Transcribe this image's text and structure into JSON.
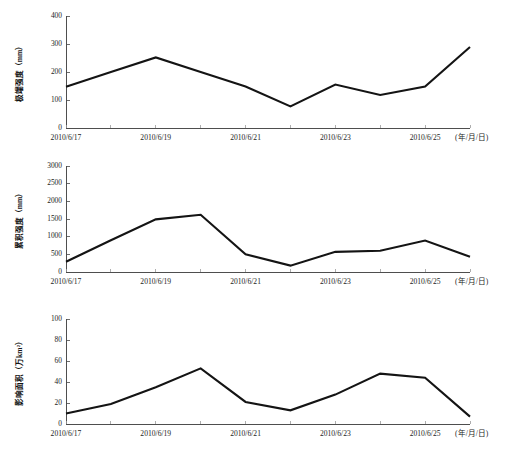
{
  "figure": {
    "background": "#ffffff",
    "line_color": "#141414",
    "axis_color": "#3b3b3b",
    "panel_count": 3
  },
  "chart_data": [
    {
      "type": "line",
      "panel": "top",
      "title": "",
      "xlabel": "(年/月/日)",
      "ylabel": "极端强度（mm）",
      "ylim": [
        0,
        400
      ],
      "yticks": [
        0,
        100,
        200,
        300,
        400
      ],
      "ytick_labels": [
        "0",
        "100",
        "200",
        "300",
        "400"
      ],
      "xlim_index": [
        0,
        9
      ],
      "x": [
        "2010/6/17",
        "2010/6/18",
        "2010/6/19",
        "2010/6/20",
        "2010/6/21",
        "2010/6/22",
        "2010/6/23",
        "2010/6/24",
        "2010/6/25",
        "2010/6/26"
      ],
      "xtick_labels": [
        "2010/6/17",
        "",
        "2010/6/19",
        "",
        "2010/6/21",
        "",
        "2010/6/23",
        "",
        "2010/6/25",
        ""
      ],
      "xtick_labels_visible": [
        "2010/6/17",
        "2010/6/19",
        "2010/6/21",
        "2010/6/23",
        "2010/6/25"
      ],
      "values": [
        147,
        200,
        252,
        200,
        148,
        77,
        155,
        118,
        148,
        289
      ],
      "grid": false,
      "legend": "none",
      "series_name": "极端强度"
    },
    {
      "type": "line",
      "panel": "middle",
      "title": "",
      "xlabel": "(年/月/日)",
      "ylabel": "累积强度（mm）",
      "ylim": [
        0,
        3000
      ],
      "yticks": [
        0,
        500,
        1000,
        1500,
        2000,
        2500,
        3000
      ],
      "ytick_labels": [
        "0",
        "500",
        "1000",
        "1500",
        "2000",
        "2500",
        "3000"
      ],
      "xlim_index": [
        0,
        9
      ],
      "x": [
        "2010/6/17",
        "2010/6/18",
        "2010/6/19",
        "2010/6/20",
        "2010/6/21",
        "2010/6/22",
        "2010/6/23",
        "2010/6/24",
        "2010/6/25",
        "2010/6/26"
      ],
      "xtick_labels": [
        "2010/6/17",
        "",
        "2010/6/19",
        "",
        "2010/6/21",
        "",
        "2010/6/23",
        "",
        "2010/6/25",
        ""
      ],
      "xtick_labels_visible": [
        "2010/6/17",
        "2010/6/19",
        "2010/6/21",
        "2010/6/23",
        "2010/6/25"
      ],
      "values": [
        290,
        900,
        1490,
        1620,
        500,
        180,
        570,
        600,
        890,
        430
      ],
      "grid": false,
      "legend": "none",
      "series_name": "累积强度"
    },
    {
      "type": "line",
      "panel": "bottom",
      "title": "",
      "xlabel": "(年/月/日)",
      "ylabel": "影响面积（万km²）",
      "ylim": [
        0,
        100
      ],
      "yticks": [
        0,
        20,
        40,
        60,
        80,
        100
      ],
      "ytick_labels": [
        "0",
        "20",
        "40",
        "60",
        "80",
        "100"
      ],
      "xlim_index": [
        0,
        9
      ],
      "x": [
        "2010/6/17",
        "2010/6/18",
        "2010/6/19",
        "2010/6/20",
        "2010/6/21",
        "2010/6/22",
        "2010/6/23",
        "2010/6/24",
        "2010/6/25",
        "2010/6/26"
      ],
      "xtick_labels": [
        "2010/6/17",
        "",
        "2010/6/19",
        "",
        "2010/6/21",
        "",
        "2010/6/23",
        "",
        "2010/6/25",
        ""
      ],
      "xtick_labels_visible": [
        "2010/6/17",
        "2010/6/19",
        "2010/6/21",
        "2010/6/23",
        "2010/6/25"
      ],
      "values": [
        10,
        19,
        35,
        53,
        21,
        13,
        28,
        48,
        44,
        7
      ],
      "grid": false,
      "legend": "none",
      "series_name": "影响面积"
    }
  ]
}
